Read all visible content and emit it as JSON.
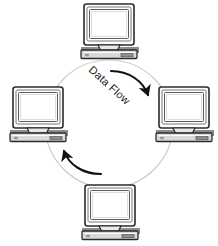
{
  "diagram": {
    "type": "ring-network-topology",
    "title": "Data Flow",
    "background_color": "#ffffff",
    "ring": {
      "name": "connection-circle",
      "center_x": 109,
      "center_y": 124,
      "radius": 64,
      "stroke_color": "#c9c9c9",
      "stroke_width": 1.1
    },
    "flow_label": {
      "text": "Data Flow",
      "color": "#1a1a1a",
      "rotation_degrees": 42,
      "x": 107,
      "y": 88
    },
    "arrows": [
      {
        "name": "clockwise-arrow-top-right",
        "direction": "clockwise",
        "color": "#111111",
        "start": [
          113,
          72
        ],
        "end": [
          147,
          97
        ]
      },
      {
        "name": "clockwise-arrow-bottom-left",
        "direction": "clockwise",
        "color": "#111111",
        "start": [
          99,
          172
        ],
        "end": [
          64,
          147
        ]
      }
    ],
    "nodes": [
      {
        "name": "computer-node-top",
        "position": "top",
        "x": 109,
        "y": 31,
        "device": "desktop-computer"
      },
      {
        "name": "computer-node-right",
        "position": "right",
        "x": 184,
        "y": 114,
        "device": "desktop-computer"
      },
      {
        "name": "computer-node-bottom",
        "position": "bottom",
        "x": 110,
        "y": 212,
        "device": "desktop-computer"
      },
      {
        "name": "computer-node-left",
        "position": "left",
        "x": 38,
        "y": 114,
        "device": "desktop-computer"
      }
    ],
    "computer_style": {
      "monitor_outline": "#2b2b2b",
      "monitor_fill": "#ffffff",
      "screen_fill": "#fbfbfb",
      "screen_outline": "#6e6e6e",
      "base_fill": "#d8d8d8",
      "base_outline": "#2b2b2b",
      "shadow_fill": "#8a8a8a"
    }
  }
}
